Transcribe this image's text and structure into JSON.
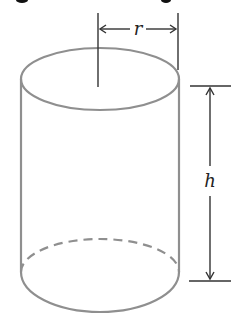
{
  "figure": {
    "title_fragment": "",
    "shape": "right circular cylinder",
    "labels": {
      "radius": "r",
      "height": "h"
    },
    "colors": {
      "outline": "#8f8f8f",
      "dimension": "#333333",
      "background": "#ffffff"
    }
  }
}
